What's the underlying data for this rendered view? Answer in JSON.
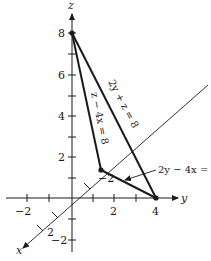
{
  "figure": {
    "axes": {
      "z_label": "z",
      "y_label": "y",
      "x_label": "x"
    },
    "z_ticks": [
      {
        "label": "8",
        "value": 8
      },
      {
        "label": "6",
        "value": 6
      },
      {
        "label": "4",
        "value": 4
      },
      {
        "label": "2",
        "value": 2
      },
      {
        "label": "−2",
        "value": -2
      }
    ],
    "y_ticks": [
      {
        "label": "−2",
        "value": -2
      },
      {
        "label": "2",
        "value": 2
      },
      {
        "label": "4",
        "value": 4
      }
    ],
    "x_ticks": [
      {
        "label": "−2",
        "value": -2
      },
      {
        "label": "2",
        "value": 2
      }
    ],
    "vertices": [
      {
        "name": "z-intercept",
        "coords": [
          0,
          0,
          8
        ]
      },
      {
        "name": "y-intercept",
        "coords": [
          0,
          4,
          0
        ]
      },
      {
        "name": "x-intercept",
        "coords": [
          -2,
          0,
          0
        ]
      }
    ],
    "equations": {
      "top_right": "2y + z = 8",
      "top_left": "z − 4x = 8",
      "bottom": "2y − 4x = 8"
    },
    "colors": {
      "ink": "#1a1a1a",
      "background": "#ffffff"
    }
  }
}
